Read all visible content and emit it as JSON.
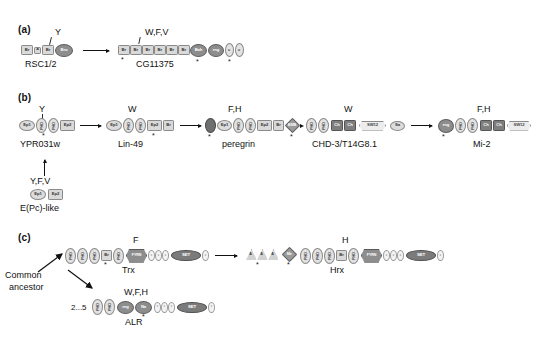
{
  "figure": {
    "panels": [
      "(a)",
      "(b)",
      "(c)"
    ]
  },
  "domain_labels": {
    "br": "Br",
    "a": "A",
    "bro": "Bro",
    "bah": "Bah",
    "ring": "rng",
    "cys": "c",
    "ep1": "Ep1",
    "ep2": "Ep2",
    "phd": "PHD",
    "zn": "Zn",
    "bmb": "BMB",
    "ch": "Ch",
    "sw12": "SW12",
    "sa": "Sa",
    "set": "SET",
    "fyrn": "FYRN",
    "fyrc": "FYRC",
    "me": "Me",
    "at": "A"
  },
  "panel_a": {
    "letter": "(a)",
    "left_protein": {
      "name": "RSC1/2",
      "top_label": "Y",
      "domains": [
        "Br",
        "A",
        "Br",
        "Bro"
      ]
    },
    "right_protein": {
      "name": "CG11375",
      "top_label": "W,F,V",
      "domains": [
        "Br",
        "Br",
        "Br",
        "Br",
        "Br",
        "Br",
        "Bah",
        "rng",
        "c",
        "c"
      ]
    }
  },
  "panel_b": {
    "letter": "(b)",
    "proteins": [
      {
        "name": "YPR031w",
        "top_label": "Y",
        "domains": [
          "Ep1",
          "PHD",
          "PHD",
          "Ep2"
        ]
      },
      {
        "name": "Lin-49",
        "top_label": "W",
        "domains": [
          "Ep1",
          "PHD",
          "PHD",
          "Ep2",
          "Br"
        ]
      },
      {
        "name": "peregrin",
        "top_label": "F,H",
        "domains": [
          "Zn",
          "Ep1",
          "PHD",
          "PHD",
          "Ep2",
          "Br",
          "BMB"
        ]
      },
      {
        "name": "CHD-3/T14G8.1",
        "top_label": "W",
        "domains": [
          "PHD",
          "PHD",
          "Ch",
          "Ch",
          "SW12",
          "Sa"
        ]
      },
      {
        "name": "Mi-2",
        "top_label": "F,H",
        "domains": [
          "rng",
          "PHD",
          "PHD",
          "Ch",
          "Ch",
          "SW12",
          "Sa"
        ]
      }
    ],
    "ancestor": {
      "name": "E(Pc)-like",
      "top_label": "Y,F,V",
      "domains": [
        "Ep1",
        "Ep2"
      ]
    }
  },
  "panel_c": {
    "letter": "(c)",
    "common_ancestor_label": "Common\nancestor",
    "common_ancestor_line1": "Common",
    "common_ancestor_line2": "ancestor",
    "repeat_label": "2...5",
    "proteins": [
      {
        "name": "Trx",
        "top_label": "F",
        "domains": [
          "PHD",
          "PHD",
          "PHD",
          "Br",
          "PHD",
          "FYRN",
          "c",
          "c",
          "c",
          "SET",
          "c"
        ]
      },
      {
        "name": "Hrx",
        "top_label": "H",
        "domains": [
          "A",
          "A",
          "A",
          "Me",
          "PHD",
          "PHD",
          "PHD",
          "Br",
          "PHD",
          "FYRN",
          "c",
          "c",
          "c",
          "SET",
          "c"
        ]
      },
      {
        "name": "ALR",
        "top_label": "W,F,H",
        "domains": [
          "PHD",
          "PHD",
          "rng",
          "Na",
          "c",
          "c",
          "c",
          "SET",
          "c"
        ]
      }
    ]
  }
}
